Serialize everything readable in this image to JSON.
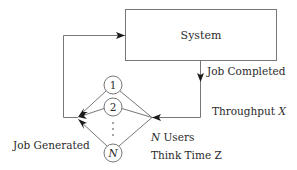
{
  "diagram": {
    "type": "closed-queueing-network",
    "system": {
      "label": "System"
    },
    "edges": {
      "to_system": "Job Generated → System",
      "from_system": "System → Users"
    },
    "labels": {
      "job_completed": "Job Completed",
      "throughput_prefix": "Throughput ",
      "throughput_var": "X",
      "job_generated": "Job Generated",
      "users_var": "N",
      "users_suffix": " Users",
      "think_time_prefix": "Think Time ",
      "think_time_var": "Z"
    },
    "users": [
      {
        "label": "1",
        "italic": false
      },
      {
        "label": "2",
        "italic": false
      },
      {
        "label": "N",
        "italic": true
      }
    ],
    "ellipsis": "⋮",
    "colors": {
      "line": "#777777",
      "text": "#2b2b2b",
      "arrow": "#1a1a1a"
    }
  }
}
